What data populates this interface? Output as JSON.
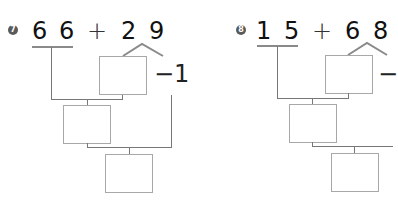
{
  "problems": [
    {
      "number": "7",
      "left_tens": "6",
      "left_ones": "6",
      "operator": "+",
      "right_tens": "2",
      "right_ones": "9",
      "adjust_label": "−1"
    },
    {
      "number": "8",
      "left_tens": "1",
      "left_ones": "5",
      "operator": "+",
      "right_tens": "6",
      "right_ones": "8",
      "adjust_label": "−"
    }
  ],
  "colors": {
    "digits": "#111111",
    "lines": "#777777",
    "boxes": "#a8a8a8",
    "badge": "#5a5a5a"
  }
}
